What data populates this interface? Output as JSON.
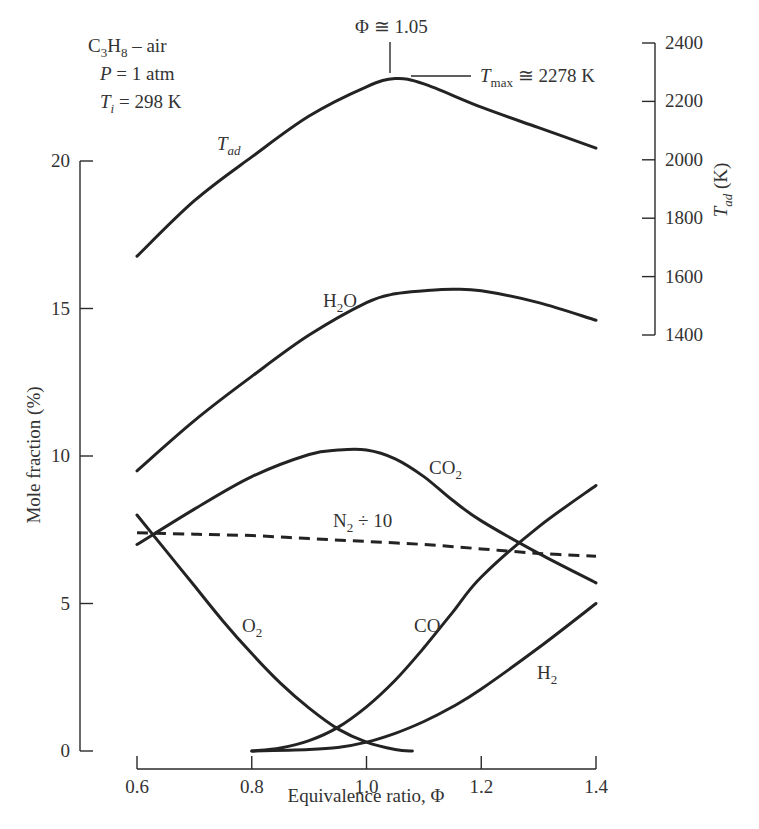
{
  "chart_data": {
    "type": "line",
    "title": "",
    "conditions": [
      "C3H8 – air",
      "P = 1 atm",
      "Ti = 298 K"
    ],
    "xlabel": "Equivalence ratio, Φ",
    "ylabel": "Mole fraction (%)",
    "y2label": "Tad (K)",
    "xlim": [
      0.6,
      1.4
    ],
    "ylim": [
      0,
      20
    ],
    "y2lim": [
      1400,
      2400
    ],
    "x_ticks": [
      "0.6",
      "0.8",
      "1.0",
      "1.2",
      "1.4"
    ],
    "y_ticks": [
      "0",
      "5",
      "10",
      "15",
      "20"
    ],
    "y2_ticks": [
      "1400",
      "1600",
      "1800",
      "2000",
      "2200",
      "2400"
    ],
    "grid": false,
    "legend": "inline labels",
    "annotations": [
      {
        "text": "Φ ≅ 1.05",
        "target": "Tad peak location"
      },
      {
        "text": "Tmax ≅ 2278 K",
        "target": "Tad peak value"
      }
    ],
    "series": [
      {
        "name": "Tad",
        "axis": "right",
        "style": "solid",
        "x": [
          0.6,
          0.7,
          0.8,
          0.9,
          1.0,
          1.05,
          1.1,
          1.2,
          1.3,
          1.4
        ],
        "y": [
          1670,
          1860,
          2010,
          2150,
          2250,
          2278,
          2260,
          2180,
          2110,
          2040
        ]
      },
      {
        "name": "H2O",
        "axis": "left",
        "style": "solid",
        "x": [
          0.6,
          0.7,
          0.8,
          0.9,
          1.0,
          1.05,
          1.1,
          1.15,
          1.2,
          1.3,
          1.4
        ],
        "y": [
          9.5,
          11.2,
          12.7,
          14.1,
          15.2,
          15.5,
          15.6,
          15.65,
          15.6,
          15.2,
          14.6
        ]
      },
      {
        "name": "CO2",
        "axis": "left",
        "style": "solid",
        "x": [
          0.6,
          0.7,
          0.8,
          0.9,
          0.95,
          1.0,
          1.05,
          1.1,
          1.15,
          1.2,
          1.3,
          1.4
        ],
        "y": [
          7.0,
          8.2,
          9.3,
          10.05,
          10.2,
          10.2,
          9.9,
          9.3,
          8.5,
          7.8,
          6.7,
          5.7
        ]
      },
      {
        "name": "N2 ÷ 10",
        "axis": "left",
        "style": "dashed",
        "x": [
          0.6,
          0.7,
          0.8,
          0.9,
          1.0,
          1.1,
          1.2,
          1.3,
          1.4
        ],
        "y": [
          7.4,
          7.35,
          7.3,
          7.2,
          7.1,
          7.0,
          6.85,
          6.7,
          6.6
        ]
      },
      {
        "name": "O2",
        "axis": "left",
        "style": "solid",
        "x": [
          0.6,
          0.65,
          0.7,
          0.75,
          0.8,
          0.85,
          0.9,
          0.95,
          1.0,
          1.05,
          1.08
        ],
        "y": [
          8.0,
          6.8,
          5.6,
          4.4,
          3.3,
          2.3,
          1.45,
          0.75,
          0.3,
          0.05,
          0.0
        ]
      },
      {
        "name": "CO",
        "axis": "left",
        "style": "solid",
        "x": [
          0.8,
          0.85,
          0.9,
          0.95,
          1.0,
          1.05,
          1.1,
          1.15,
          1.2,
          1.3,
          1.4
        ],
        "y": [
          0.0,
          0.1,
          0.35,
          0.8,
          1.5,
          2.4,
          3.5,
          4.7,
          5.9,
          7.6,
          9.0
        ]
      },
      {
        "name": "H2",
        "axis": "left",
        "style": "solid",
        "x": [
          0.8,
          0.9,
          0.95,
          1.0,
          1.05,
          1.1,
          1.15,
          1.2,
          1.3,
          1.4
        ],
        "y": [
          0.0,
          0.05,
          0.12,
          0.3,
          0.6,
          1.0,
          1.5,
          2.1,
          3.5,
          5.0
        ]
      }
    ],
    "labels": {
      "Tad": "T",
      "Tad_sub": "ad",
      "H2O_main": "H",
      "H2O_sub": "2",
      "H2O_tail": "O",
      "CO2_main": "CO",
      "CO2_sub": "2",
      "N2_main": "N",
      "N2_sub": "2",
      "N2_tail": " ÷ 10",
      "O2_main": "O",
      "O2_sub": "2",
      "CO": "CO",
      "H2_main": "H",
      "H2_sub": "2",
      "cond1_a": "C",
      "cond1_s1": "3",
      "cond1_b": "H",
      "cond1_s2": "8",
      "cond1_c": " – air",
      "cond2_a": "P",
      "cond2_b": " = 1 atm",
      "cond3_a": "T",
      "cond3_s": "i",
      "cond3_b": " = 298 K",
      "phi_peak": "Φ ≅ 1.05",
      "tmax_a": "T",
      "tmax_s": "max",
      "tmax_b": " ≅ 2278 K",
      "y2title_a": "T",
      "y2title_s": "ad",
      "y2title_b": " (K)"
    }
  }
}
